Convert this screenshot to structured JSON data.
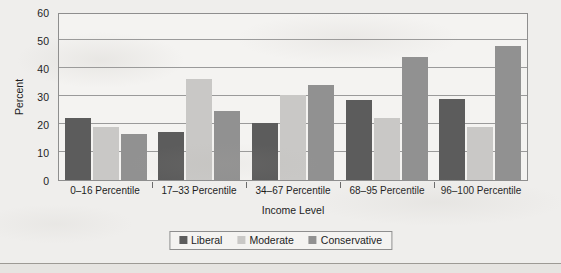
{
  "chart_data": {
    "type": "bar",
    "title": "",
    "xlabel": "Income Level",
    "ylabel": "Percent",
    "ylim": [
      0,
      60
    ],
    "yticks": [
      0,
      10,
      20,
      30,
      40,
      50,
      60
    ],
    "grid": true,
    "legend_position": "bottom",
    "categories": [
      "0–16 Percentile",
      "17–33 Percentile",
      "34–67 Percentile",
      "68–95 Percentile",
      "96–100 Percentile"
    ],
    "series": [
      {
        "name": "Liberal",
        "color": "#5c5c5c",
        "values": [
          22,
          17,
          20.5,
          28.5,
          29
        ]
      },
      {
        "name": "Moderate",
        "color": "#c9c8c6",
        "values": [
          19,
          36,
          30.5,
          22,
          19
        ]
      },
      {
        "name": "Conservative",
        "color": "#919191",
        "values": [
          16.5,
          24.5,
          34,
          44,
          48
        ]
      }
    ]
  },
  "axes": {
    "y_title": "Percent",
    "x_title": "Income Level",
    "y_tick_labels": [
      "0",
      "10",
      "20",
      "30",
      "40",
      "50",
      "60"
    ]
  },
  "legend": {
    "entries": [
      {
        "label": "Liberal",
        "swatch_color": "#5c5c5c"
      },
      {
        "label": "Moderate",
        "swatch_color": "#c9c8c6"
      },
      {
        "label": "Conservative",
        "swatch_color": "#919191"
      }
    ]
  },
  "colors": {
    "page_background": "#efeeec",
    "plot_background": "#f4f3f1",
    "frame": "#8e8e8e",
    "gridline": "#9a9a9a",
    "text": "#1d1d1d"
  }
}
